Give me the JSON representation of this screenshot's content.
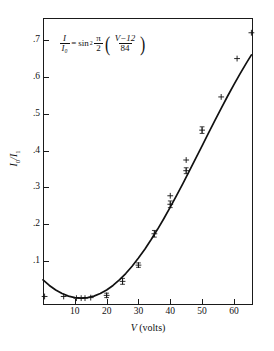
{
  "figure": {
    "equation": {
      "lhs_num": "I",
      "lhs_den": "I₀",
      "equals": "=",
      "sin": "sin",
      "exponent": "2",
      "pi": "π",
      "two": "2",
      "inner_num": "V−12",
      "inner_den": "84",
      "plain": "I/I0 = sin^2 (pi/2) ((V-12)/84)"
    },
    "xaxis": {
      "title_italic": "V",
      "title_rest": " (volts)",
      "ticks": [
        {
          "value": 10,
          "label": "10"
        },
        {
          "value": 20,
          "label": "20"
        },
        {
          "value": 30,
          "label": "30"
        },
        {
          "value": 40,
          "label": "40"
        },
        {
          "value": 50,
          "label": "50"
        },
        {
          "value": 60,
          "label": "60"
        }
      ],
      "min": 0,
      "max": 66
    },
    "yaxis": {
      "title_parts": [
        "I",
        "0",
        "/I",
        "1"
      ],
      "title_plain": "I₀/I₁",
      "ticks": [
        {
          "value": 0.1,
          "label": ".1"
        },
        {
          "value": 0.2,
          "label": ".2"
        },
        {
          "value": 0.3,
          "label": ".3"
        },
        {
          "value": 0.4,
          "label": ".4"
        },
        {
          "value": 0.5,
          "label": ".5"
        },
        {
          "value": 0.6,
          "label": ".6"
        },
        {
          "value": 0.7,
          "label": ".7"
        }
      ],
      "min": -0.0186,
      "max": 0.7595
    }
  },
  "chart_data": {
    "type": "scatter",
    "title": "",
    "subtitle": "",
    "xlabel": "V (volts)",
    "ylabel": "I₀/I₁",
    "xlim": [
      0,
      66
    ],
    "ylim": [
      -0.0186,
      0.7595
    ],
    "grid": false,
    "legend": null,
    "annotations": [
      {
        "text": "I/I₀ = sin² (π/2)((V−12)/84)",
        "x": 18,
        "y": 0.655
      }
    ],
    "series": [
      {
        "name": "fit curve",
        "type": "line",
        "formula": "I/I0 = sin^2( (pi/2) * (V-12)/84 )",
        "color": "#111111",
        "points": [
          {
            "x": 0.0,
            "y": 0.0496
          },
          {
            "x": 2.0,
            "y": 0.0344
          },
          {
            "x": 4.0,
            "y": 0.0221
          },
          {
            "x": 6.0,
            "y": 0.0124
          },
          {
            "x": 8.0,
            "y": 0.0055
          },
          {
            "x": 10.0,
            "y": 0.0014
          },
          {
            "x": 12.0,
            "y": 0.0
          },
          {
            "x": 14.0,
            "y": 0.0014
          },
          {
            "x": 16.0,
            "y": 0.0055
          },
          {
            "x": 18.0,
            "y": 0.0124
          },
          {
            "x": 20.0,
            "y": 0.0221
          },
          {
            "x": 22.0,
            "y": 0.0344
          },
          {
            "x": 24.0,
            "y": 0.0493
          },
          {
            "x": 26.0,
            "y": 0.0667
          },
          {
            "x": 28.0,
            "y": 0.0865
          },
          {
            "x": 30.0,
            "y": 0.1086
          },
          {
            "x": 32.0,
            "y": 0.1327
          },
          {
            "x": 34.0,
            "y": 0.1588
          },
          {
            "x": 36.0,
            "y": 0.1866
          },
          {
            "x": 38.0,
            "y": 0.216
          },
          {
            "x": 40.0,
            "y": 0.2467
          },
          {
            "x": 42.0,
            "y": 0.2786
          },
          {
            "x": 44.0,
            "y": 0.3114
          },
          {
            "x": 46.0,
            "y": 0.3449
          },
          {
            "x": 48.0,
            "y": 0.3789
          },
          {
            "x": 50.0,
            "y": 0.4131
          },
          {
            "x": 52.0,
            "y": 0.4473
          },
          {
            "x": 54.0,
            "y": 0.4812
          },
          {
            "x": 56.0,
            "y": 0.5146
          },
          {
            "x": 58.0,
            "y": 0.5473
          },
          {
            "x": 60.0,
            "y": 0.579
          },
          {
            "x": 62.0,
            "y": 0.6095
          },
          {
            "x": 64.0,
            "y": 0.6386
          },
          {
            "x": 65.5,
            "y": 0.6594
          }
        ]
      },
      {
        "name": "measurements",
        "type": "scatter",
        "marker": "plus",
        "color": "#111111",
        "points": [
          {
            "x": 0.5,
            "y": 0.0045,
            "err": 0.0
          },
          {
            "x": 6.5,
            "y": 0.0045,
            "err": 0.0
          },
          {
            "x": 10.5,
            "y": 0.0,
            "err": 0.0
          },
          {
            "x": 12.0,
            "y": 0.0,
            "err": 0.0
          },
          {
            "x": 13.2,
            "y": 0.0,
            "err": 0.0
          },
          {
            "x": 15.0,
            "y": 0.0014,
            "err": 0.0
          },
          {
            "x": 20.0,
            "y": 0.0075,
            "err": 0.006
          },
          {
            "x": 25.0,
            "y": 0.0455,
            "err": 0.008
          },
          {
            "x": 30.0,
            "y": 0.0895,
            "err": 0.006
          },
          {
            "x": 35.0,
            "y": 0.1745,
            "err": 0.009
          },
          {
            "x": 40.0,
            "y": 0.2545,
            "err": 0.009
          },
          {
            "x": 40.0,
            "y": 0.2775,
            "err": 0.0
          },
          {
            "x": 45.0,
            "y": 0.3455,
            "err": 0.008
          },
          {
            "x": 45.0,
            "y": 0.3745,
            "err": 0.0
          },
          {
            "x": 50.0,
            "y": 0.4555,
            "err": 0.009
          },
          {
            "x": 56.0,
            "y": 0.5455,
            "err": 0.0
          },
          {
            "x": 61.0,
            "y": 0.6495,
            "err": 0.0
          },
          {
            "x": 65.5,
            "y": 0.7195,
            "err": 0.0
          }
        ]
      }
    ]
  }
}
